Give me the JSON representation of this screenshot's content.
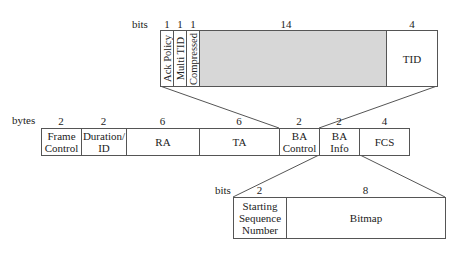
{
  "top_field": {
    "unit": "bits",
    "sizes": [
      "1",
      "1",
      "1",
      "14",
      "4"
    ],
    "cells": [
      "Ack Policy",
      "Multi TID",
      "Compressed",
      "",
      "TID"
    ]
  },
  "main_frame": {
    "unit": "bytes",
    "sizes": [
      "2",
      "2",
      "6",
      "6",
      "2",
      "2",
      "4"
    ],
    "cells": [
      "Frame Control",
      "Duration/ ID",
      "RA",
      "TA",
      "BA Control",
      "BA Info",
      "FCS"
    ]
  },
  "bottom_field": {
    "unit": "bits",
    "sizes": [
      "2",
      "8"
    ],
    "cells": [
      "Starting Sequence Number",
      "Bitmap"
    ]
  },
  "colors": {
    "reserved_fill": "#d7d7d7",
    "line": "#555555"
  }
}
